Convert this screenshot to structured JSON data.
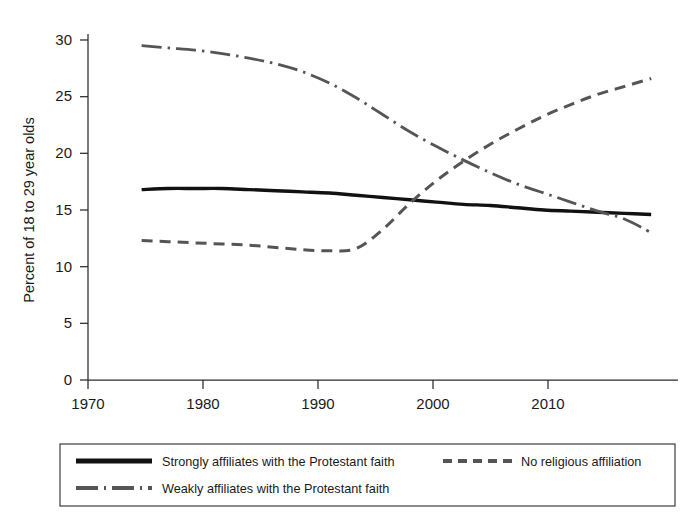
{
  "chart_data": {
    "type": "line",
    "title": "",
    "subtitle": "",
    "xlabel": "",
    "ylabel": "Percent of 18 to 29 year olds",
    "xlim": [
      1970,
      2014
    ],
    "ylim": [
      0,
      30
    ],
    "grid": false,
    "legend_position": "bottom",
    "xticks": [
      "1970",
      "1980",
      "1990",
      "2000",
      "2010"
    ],
    "xtick_values": [
      1970,
      1980,
      1990,
      2000,
      2010
    ],
    "yticks": [
      "0",
      "5",
      "10",
      "15",
      "20",
      "25",
      "30"
    ],
    "ytick_values": [
      0,
      5,
      10,
      15,
      20,
      25,
      30
    ],
    "x": [
      1974,
      1976,
      1978,
      1980,
      1982,
      1984,
      1986,
      1988,
      1990,
      1992,
      1994,
      1996,
      1998,
      2000,
      2002,
      2004,
      2006,
      2008,
      2010,
      2012
    ],
    "series": [
      {
        "name": "Strongly affiliates with the Protestant faith",
        "style": "solid",
        "color": "#111111",
        "width": 3.4,
        "values": [
          16.8,
          16.9,
          16.9,
          16.9,
          16.8,
          16.7,
          16.6,
          16.5,
          16.3,
          16.1,
          15.9,
          15.7,
          15.5,
          15.4,
          15.2,
          15.0,
          14.9,
          14.8,
          14.7,
          14.6
        ]
      },
      {
        "name": "Weakly affiliates with the Protestant faith",
        "style": "dashdot",
        "color": "#555555",
        "width": 2.8,
        "values": [
          29.5,
          29.3,
          29.1,
          28.8,
          28.4,
          27.9,
          27.2,
          26.2,
          24.9,
          23.4,
          21.9,
          20.6,
          19.4,
          18.3,
          17.3,
          16.5,
          15.7,
          14.9,
          14.2,
          13.0
        ]
      },
      {
        "name": "No religious affiliation",
        "style": "dashed",
        "color": "#555555",
        "width": 3.0,
        "values": [
          12.3,
          12.2,
          12.1,
          12.0,
          11.9,
          11.7,
          11.5,
          11.4,
          11.6,
          13.3,
          15.6,
          17.6,
          19.3,
          20.8,
          22.1,
          23.3,
          24.3,
          25.2,
          25.9,
          26.6
        ]
      }
    ]
  },
  "axes": {
    "ylabel": "Percent of 18 to 29 year olds",
    "ytick_0": "0",
    "ytick_5": "5",
    "ytick_10": "10",
    "ytick_15": "15",
    "ytick_20": "20",
    "ytick_25": "25",
    "ytick_30": "30",
    "xtick_1970": "1970",
    "xtick_1980": "1980",
    "xtick_1990": "1990",
    "xtick_2000": "2000",
    "xtick_2010": "2010"
  },
  "legend": {
    "entries": [
      {
        "label": "Strongly affiliates with the Protestant faith",
        "style": "solid"
      },
      {
        "label": "No religious affiliation",
        "style": "dashed"
      },
      {
        "label": "Weakly affiliates with the Protestant faith",
        "style": "dashdot"
      }
    ]
  },
  "colors": {
    "solid_series": "#111111",
    "dashed_series": "#555555",
    "dashdot_series": "#555555",
    "axis": "#2b2b2b",
    "background": "#ffffff"
  }
}
